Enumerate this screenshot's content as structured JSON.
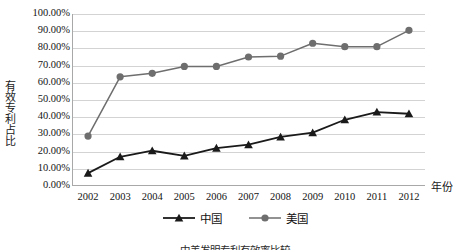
{
  "chart_data": {
    "type": "line",
    "title": "",
    "xlabel": "年份",
    "ylabel": "有效专利占比",
    "categories": [
      "2002",
      "2003",
      "2004",
      "2005",
      "2006",
      "2007",
      "2008",
      "2009",
      "2010",
      "2011",
      "2012"
    ],
    "ylim": [
      0,
      100
    ],
    "ytick_labels": [
      "100.00%",
      "90.00%",
      "80.00%",
      "70.00%",
      "60.00%",
      "50.00%",
      "40.00%",
      "30.00%",
      "20.00%",
      "10.00%",
      "0.00%"
    ],
    "ytick_values": [
      100,
      90,
      80,
      70,
      60,
      50,
      40,
      30,
      20,
      10,
      0
    ],
    "grid": true,
    "legend_position": "bottom",
    "series": [
      {
        "name": "中国",
        "marker": "triangle",
        "color": "#1a1a1a",
        "values": [
          7.5,
          17.0,
          20.5,
          17.5,
          22.0,
          24.0,
          28.5,
          31.0,
          38.5,
          43.0,
          42.0
        ]
      },
      {
        "name": "美国",
        "marker": "circle",
        "color": "#6e6e6e",
        "values": [
          29.0,
          63.5,
          65.5,
          69.5,
          69.5,
          75.0,
          75.5,
          83.0,
          81.0,
          81.0,
          90.5
        ]
      }
    ]
  },
  "legend": {
    "items": [
      {
        "label": "中国"
      },
      {
        "label": "美国"
      }
    ]
  },
  "caption": {
    "text": "中美发明专利有效率比较"
  }
}
